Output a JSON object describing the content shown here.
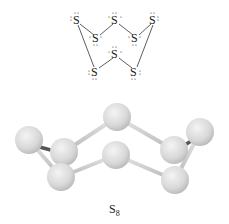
{
  "lewis_structure": {
    "atom_symbol": "S",
    "atoms": [
      {
        "id": 1,
        "x": 78,
        "y": 20
      },
      {
        "id": 2,
        "x": 116,
        "y": 20
      },
      {
        "id": 3,
        "x": 154,
        "y": 20
      },
      {
        "id": 4,
        "x": 97,
        "y": 38
      },
      {
        "id": 5,
        "x": 136,
        "y": 38
      },
      {
        "id": 6,
        "x": 116,
        "y": 54
      },
      {
        "id": 7,
        "x": 96,
        "y": 72
      },
      {
        "id": 8,
        "x": 135,
        "y": 72
      }
    ],
    "bonds": [
      [
        1,
        4
      ],
      [
        4,
        2
      ],
      [
        2,
        5
      ],
      [
        5,
        3
      ],
      [
        1,
        7
      ],
      [
        7,
        6
      ],
      [
        6,
        8
      ],
      [
        8,
        3
      ]
    ]
  },
  "ball_and_stick": {
    "atom_color": "#dcdcdc",
    "bond_color": "#c8c8c8"
  },
  "caption": {
    "formula": "S",
    "subscript": "8"
  }
}
